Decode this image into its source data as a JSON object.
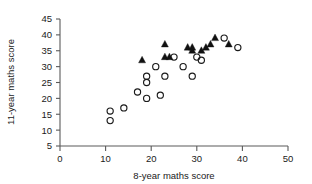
{
  "chart_data": {
    "type": "scatter",
    "title": "",
    "xlabel": "8-year maths score",
    "ylabel": "11-year maths score",
    "xlim": [
      0,
      50
    ],
    "ylim": [
      5,
      45
    ],
    "xticks": [
      0,
      10,
      20,
      30,
      40,
      50
    ],
    "yticks": [
      5,
      10,
      15,
      20,
      25,
      30,
      35,
      40,
      45
    ],
    "grid": false,
    "legend": "none",
    "series": [
      {
        "name": "open-circles",
        "marker": "open-circle",
        "color": "#1a1a1a",
        "points": [
          [
            11,
            16
          ],
          [
            11,
            13
          ],
          [
            14,
            17
          ],
          [
            17,
            22
          ],
          [
            19,
            27
          ],
          [
            19,
            25
          ],
          [
            19,
            20
          ],
          [
            21,
            30
          ],
          [
            22,
            21
          ],
          [
            23,
            27
          ],
          [
            25,
            33
          ],
          [
            27,
            30
          ],
          [
            29,
            27
          ],
          [
            30,
            33
          ],
          [
            31,
            32
          ],
          [
            36,
            39
          ],
          [
            39,
            36
          ]
        ]
      },
      {
        "name": "filled-triangles",
        "marker": "filled-triangle",
        "color": "#111111",
        "points": [
          [
            18,
            32
          ],
          [
            23,
            37
          ],
          [
            23,
            33
          ],
          [
            24,
            33
          ],
          [
            28,
            36
          ],
          [
            29,
            36
          ],
          [
            29,
            35
          ],
          [
            31,
            35
          ],
          [
            32,
            36
          ],
          [
            33,
            37
          ],
          [
            34,
            39
          ],
          [
            37,
            37
          ]
        ]
      }
    ]
  },
  "axis": {
    "x_label": "8-year maths score",
    "y_label": "11-year maths score",
    "x_tick_labels": [
      "0",
      "10",
      "20",
      "30",
      "40",
      "50"
    ],
    "y_tick_labels": [
      "5",
      "10",
      "15",
      "20",
      "25",
      "30",
      "35",
      "40",
      "45"
    ]
  },
  "colors": {
    "axis": "#5a5a5a",
    "text": "#1a1a1a",
    "marker_circle": "#1a1a1a",
    "marker_triangle": "#111111",
    "background": "#ffffff"
  }
}
